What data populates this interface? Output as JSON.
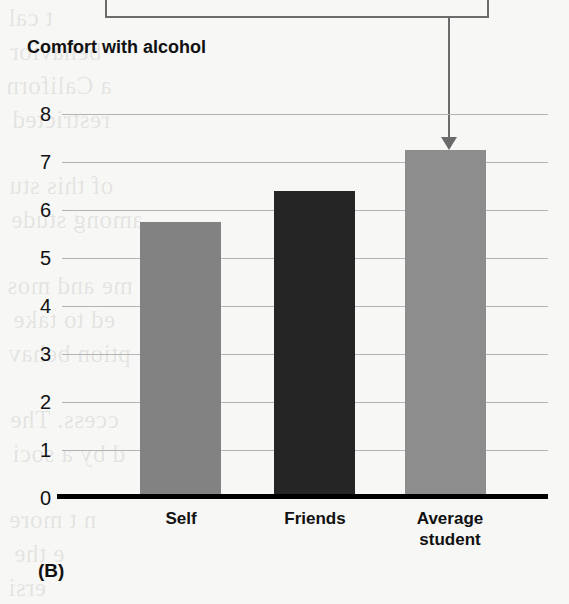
{
  "figure": {
    "panel_label": "(B)",
    "axis_title": "Comfort with alcohol",
    "callout_box_text": ""
  },
  "chart_data": {
    "type": "bar",
    "title": "Comfort with alcohol",
    "categories": [
      "Self",
      "Friends",
      "Average student"
    ],
    "values": [
      5.75,
      6.4,
      7.25
    ],
    "series": [
      {
        "name": "Comfort with alcohol",
        "values": [
          5.75,
          6.4,
          7.25
        ]
      }
    ],
    "xlabel": "",
    "ylabel": "Comfort with alcohol",
    "ylim": [
      0,
      8
    ],
    "yticks": [
      0,
      1,
      2,
      3,
      4,
      5,
      6,
      7,
      8
    ],
    "ytick_labels": [
      "0",
      "1",
      "2",
      "3",
      "4",
      "5",
      "6",
      "7",
      "8"
    ],
    "grid": true,
    "legend": false,
    "bar_colors": [
      "#828282",
      "#252525",
      "#8d8d8d"
    ],
    "annotations": [
      {
        "type": "arrow",
        "target_category": "Average student",
        "text": ""
      }
    ]
  },
  "colors": {
    "bar_self": "#828282",
    "bar_friends": "#252525",
    "bar_average": "#8d8d8d",
    "gridline": "#b4b4b4",
    "axis": "#000000",
    "callout_border": "#6b6b6b",
    "page_background": "#f7f7f5"
  },
  "background_text": [
    "t cal",
    "behavior",
    "a Californ",
    "restricted",
    "of this stu",
    "among stude",
    "me and mos",
    "ed to take",
    "ption behav",
    "ccess. The",
    "d by a soci",
    "n t more",
    "e the",
    "ersi"
  ]
}
